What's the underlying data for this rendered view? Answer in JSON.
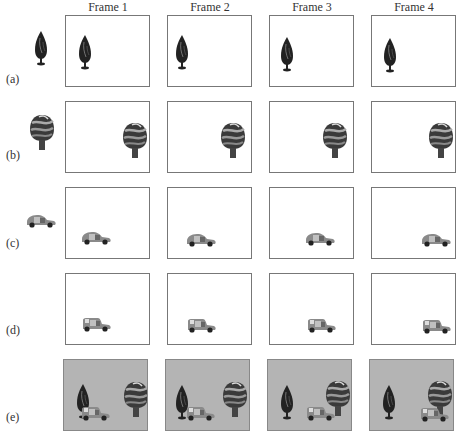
{
  "columns": [
    "Frame 1",
    "Frame 2",
    "Frame 3",
    "Frame 4"
  ],
  "rows": [
    {
      "label": "(a)",
      "description": "tree-sprite layer (static)"
    },
    {
      "label": "(b)",
      "description": "round-tree sprite layer (static)"
    },
    {
      "label": "(c)",
      "description": "car sprite layer moving right"
    },
    {
      "label": "(d)",
      "description": "car sprite layer variant moving right"
    },
    {
      "label": "(e)",
      "description": "composited frames over gray background"
    }
  ],
  "colors": {
    "frame_border": "#777777",
    "composite_background": "#b4b4b4",
    "text": "#333333"
  }
}
